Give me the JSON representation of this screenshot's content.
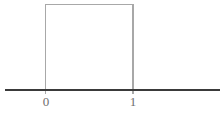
{
  "figure": {
    "title": "",
    "background_color": "#ffffff",
    "width": 223,
    "height": 115
  },
  "axis": {
    "name": "x-axis",
    "color": "#3a3a3a",
    "y_pixel": 90,
    "x_start_pixel": 5,
    "x_end_pixel": 220,
    "stroke_width": 1.6
  },
  "ticks": [
    {
      "label": "0",
      "value": 0,
      "x_pixel": 46
    },
    {
      "label": "1",
      "value": 1,
      "x_pixel": 133
    }
  ],
  "tick_label_color": "#6e6e6e",
  "shape": {
    "name": "uniform-density-rectangle",
    "color": "#a8a8a8",
    "stroke_width": 1.4,
    "left_x_pixel": 45.5,
    "right_x_pixel": 133,
    "top_y_pixel": 4.5,
    "bottom_y_pixel": 94
  },
  "chart_data": {
    "type": "line",
    "title": "",
    "subtitle": "",
    "xlabel": "",
    "ylabel": "",
    "grid": false,
    "legend": null,
    "xlim": [
      -0.52,
      1.94
    ],
    "ylim": [
      0,
      1.1
    ],
    "xticks": [
      0,
      1
    ],
    "xticklabels": [
      "0",
      "1"
    ],
    "yticks": [],
    "yticklabels": [],
    "series": [
      {
        "name": "uniform-pdf",
        "color": "#a8a8a8",
        "x": [
          0,
          0,
          1,
          1
        ],
        "y": [
          0,
          1,
          1,
          0
        ]
      }
    ],
    "annotations": []
  }
}
